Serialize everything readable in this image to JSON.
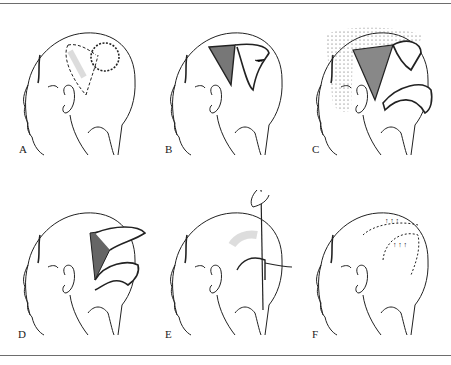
{
  "figure": {
    "panels": [
      {
        "id": "A",
        "label": "A",
        "description": "Head from behind-left; dashed outline of flap; circular defect at crown"
      },
      {
        "id": "B",
        "label": "B",
        "description": "Flap incised and raised; shaded donor bed"
      },
      {
        "id": "C",
        "label": "C",
        "description": "Undermined stippled region; flap rotated with arrows"
      },
      {
        "id": "D",
        "label": "D",
        "description": "Flap elevated over defect with shaded donor area"
      },
      {
        "id": "E",
        "label": "E",
        "description": "Hand with instrument positioning flap"
      },
      {
        "id": "F",
        "label": "F",
        "description": "Flap sutured in place with arrows showing tension direction"
      }
    ]
  }
}
